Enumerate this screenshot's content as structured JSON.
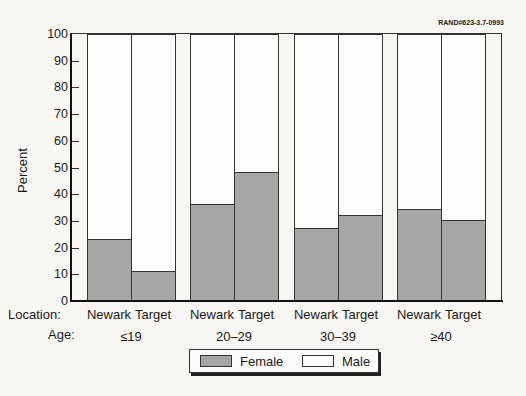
{
  "figure_id": "RAND#623-3.7-0993",
  "chart_data": {
    "type": "bar",
    "stacked": true,
    "title": "",
    "xlabel": "",
    "ylabel": "Percent",
    "ylim": [
      0,
      100
    ],
    "yticks": [
      0,
      10,
      20,
      30,
      40,
      50,
      60,
      70,
      80,
      90,
      100
    ],
    "row_labels": {
      "location": "Location:",
      "age": "Age:"
    },
    "groups": [
      {
        "age": "≤19",
        "bars": [
          {
            "location": "Newark",
            "female": 23,
            "male": 77
          },
          {
            "location": "Target",
            "female": 11,
            "male": 89
          }
        ]
      },
      {
        "age": "20–29",
        "bars": [
          {
            "location": "Newark",
            "female": 36,
            "male": 64
          },
          {
            "location": "Target",
            "female": 48,
            "male": 52
          }
        ]
      },
      {
        "age": "30–39",
        "bars": [
          {
            "location": "Newark",
            "female": 27,
            "male": 73
          },
          {
            "location": "Target",
            "female": 32,
            "male": 68
          }
        ]
      },
      {
        "age": "≥40",
        "bars": [
          {
            "location": "Newark",
            "female": 34,
            "male": 66
          },
          {
            "location": "Target",
            "female": 30,
            "male": 70
          }
        ]
      }
    ],
    "categories": [
      "≤19 Newark",
      "≤19 Target",
      "20–29 Newark",
      "20–29 Target",
      "30–39 Newark",
      "30–39 Target",
      "≥40 Newark",
      "≥40 Target"
    ],
    "series": [
      {
        "name": "Female",
        "values": [
          23,
          11,
          36,
          48,
          27,
          32,
          34,
          30
        ],
        "color": "#a6a6a6"
      },
      {
        "name": "Male",
        "values": [
          77,
          89,
          64,
          52,
          73,
          68,
          66,
          70
        ],
        "color": "#ffffff"
      }
    ],
    "legend": {
      "position": "bottom",
      "entries": [
        "Female",
        "Male"
      ]
    },
    "grid": false
  }
}
